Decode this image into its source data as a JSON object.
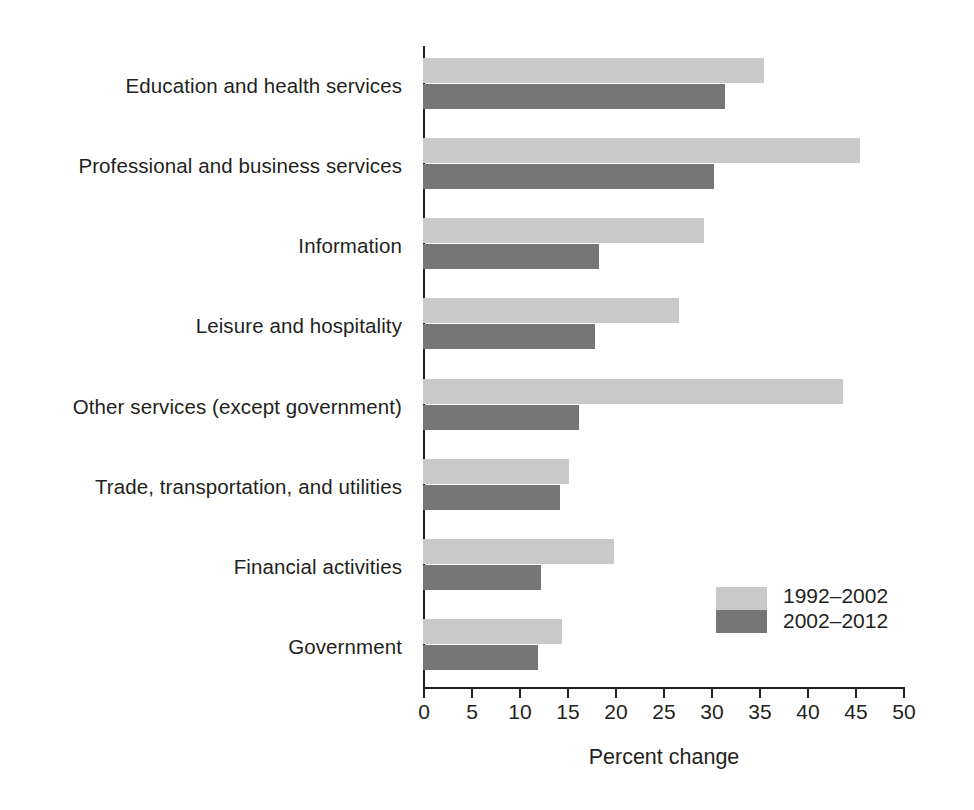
{
  "chart_data": {
    "type": "bar",
    "orientation": "horizontal",
    "title": "",
    "subtitle": "",
    "xlabel": "Percent change",
    "ylabel": "",
    "xlim": [
      0,
      50
    ],
    "xticks": [
      0,
      5,
      10,
      15,
      20,
      25,
      30,
      35,
      40,
      45,
      50
    ],
    "xtick_labels": [
      "0",
      "5",
      "10",
      "15",
      "20",
      "25",
      "30",
      "35",
      "40",
      "45",
      "50"
    ],
    "grid": false,
    "legend_position": "inside-lower-right",
    "categories": [
      "Education and health services",
      "Professional and business services",
      "Information",
      "Leisure and hospitality",
      "Other services (except government)",
      "Trade, transportation, and utilities",
      "Financial activities",
      "Government"
    ],
    "series": [
      {
        "name": "1992–2002",
        "color": "#c9c9c9",
        "values": [
          35.5,
          45.5,
          29.3,
          26.7,
          43.8,
          15.2,
          19.9,
          14.5
        ]
      },
      {
        "name": "2002–2012",
        "color": "#767676",
        "values": [
          31.5,
          30.3,
          18.3,
          17.9,
          16.3,
          14.3,
          12.3,
          12.0
        ]
      }
    ]
  },
  "colors": {
    "series_a": "#c9c9c9",
    "series_b": "#767676",
    "axis": "#231f20",
    "text": "#231f20",
    "background": "#ffffff"
  }
}
